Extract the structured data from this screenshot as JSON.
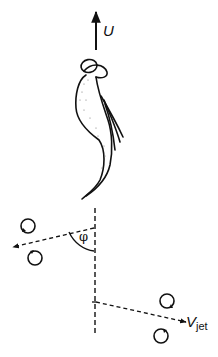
{
  "diagram": {
    "labels": {
      "swimming_velocity": "U",
      "angle": "φ",
      "jet_velocity_main": "V",
      "jet_velocity_sub": "jet"
    },
    "elements": [
      {
        "name": "swimming-direction-arrow",
        "description": "solid upward arrow labeled U"
      },
      {
        "name": "organism",
        "description": "swimming organism with head and trailing flagella"
      },
      {
        "name": "body-axis",
        "description": "vertical dashed axis line"
      },
      {
        "name": "left-jet",
        "description": "dashed arrow to the left at angle φ from axis, flanked by two vortex rings"
      },
      {
        "name": "right-jet",
        "description": "dashed arrow to the right labeled V_jet, flanked by two vortex rings"
      }
    ],
    "colors": {
      "ink": "#111111",
      "background": "#ffffff"
    }
  }
}
